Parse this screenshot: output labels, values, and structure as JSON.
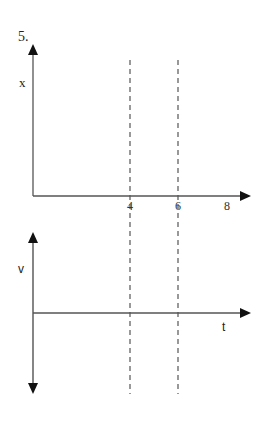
{
  "problem_number": "5.",
  "top_graph": {
    "y_label": "x",
    "x_ticks": [
      "4",
      "6",
      "8"
    ]
  },
  "bottom_graph": {
    "y_label": "v",
    "x_label": "t"
  },
  "dashed_lines_at": [
    "4",
    "6"
  ],
  "colors": {
    "axis": "#444444",
    "arrow": "#111111",
    "dashed": "#555555"
  }
}
